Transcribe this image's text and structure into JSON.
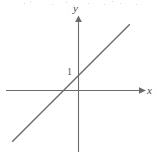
{
  "figure": {
    "background_color": "#ffffff",
    "axis_color": "#6b6b6b",
    "line_color": "#6b6b6b",
    "labels": {
      "y_axis": "y",
      "x_axis": "x",
      "y_intercept_tick": "1"
    }
  },
  "chart_data": {
    "type": "line",
    "title": "",
    "xlabel": "x",
    "ylabel": "y",
    "grid": false,
    "legend": "none",
    "axes": {
      "x_axis_label": "x",
      "y_axis_label": "y",
      "x_arrow": "right",
      "y_arrow": "up",
      "origin_px": [
        78,
        90
      ],
      "unit_px": 14,
      "xlim": [
        -5.1,
        4.6
      ],
      "ylim": [
        -4.4,
        5.1
      ]
    },
    "tick_labels": {
      "y": [
        "1"
      ],
      "x": []
    },
    "series": [
      {
        "name": "y = x + 1",
        "equation": "y = x + 1",
        "slope": 1,
        "intercept": 1,
        "x": [
          -4.7,
          3.7
        ],
        "values": [
          -3.7,
          4.7
        ]
      }
    ],
    "annotations": [
      {
        "text": "1",
        "x": 0,
        "y": 1,
        "note": "y-intercept marked on the y-axis"
      }
    ]
  },
  "scan_noise": {
    "description": "faint speckle dots along the top edge of the scan",
    "dots": [
      [
        24,
        3
      ],
      [
        52,
        4
      ],
      [
        66,
        2
      ],
      [
        88,
        3
      ],
      [
        104,
        4
      ],
      [
        120,
        3
      ],
      [
        136,
        4
      ],
      [
        30,
        1
      ],
      [
        74,
        5
      ],
      [
        112,
        1
      ]
    ]
  }
}
